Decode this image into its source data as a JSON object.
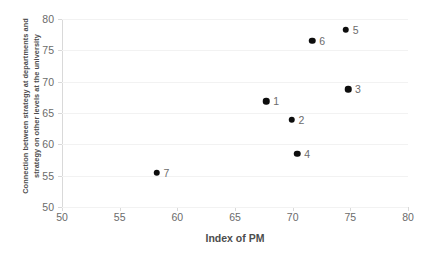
{
  "chart_data": {
    "type": "scatter",
    "title": "",
    "xlabel": "Index of PM",
    "ylabel_line1": "Connection between strategy at departments and",
    "ylabel_line2": "strategy on other levels at the university",
    "xlim": [
      50,
      80
    ],
    "ylim": [
      50,
      80
    ],
    "xticks": [
      50,
      55,
      60,
      65,
      70,
      75,
      80
    ],
    "yticks": [
      50,
      55,
      60,
      65,
      70,
      75,
      80
    ],
    "grid": "horizontal",
    "legend": "none",
    "marker_color": "#0d0d0d",
    "gridline_color": "#f2f2f2",
    "axis_color": "#d9d9d9",
    "points": [
      {
        "label": "1",
        "x": 67.7,
        "y": 66.9
      },
      {
        "label": "2",
        "x": 69.9,
        "y": 63.9
      },
      {
        "label": "3",
        "x": 74.8,
        "y": 68.8
      },
      {
        "label": "4",
        "x": 70.4,
        "y": 58.5
      },
      {
        "label": "5",
        "x": 74.6,
        "y": 78.3
      },
      {
        "label": "6",
        "x": 71.7,
        "y": 76.5
      },
      {
        "label": "7",
        "x": 58.2,
        "y": 55.5
      }
    ]
  }
}
